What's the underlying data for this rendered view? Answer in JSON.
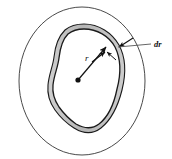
{
  "figure": {
    "labels": {
      "radius": "r",
      "thickness": "dr"
    },
    "colors": {
      "outline": "#4a4a4a",
      "blob_outline": "#1a1a1a",
      "shell_fill": "#b9b9b9",
      "shell_fill_light": "#d2d2d2",
      "background": "#ffffff",
      "label": "#111111",
      "leader": "#555555"
    },
    "geometry": {
      "outer_circle": {
        "cx": 82,
        "cy": 81,
        "r": 74,
        "stroke_width": 1
      },
      "center_dot": {
        "cx": 78,
        "cy": 80,
        "r": 2.6
      },
      "radius_arrow": {
        "x1": 78,
        "y1": 80,
        "x2": 106,
        "y2": 46
      },
      "shell_thickness_px": 4,
      "leader_line": {
        "x1": 152,
        "y1": 44,
        "x2": 117,
        "y2": 46
      },
      "dr_label_pos": {
        "x": 154,
        "y": 47
      },
      "r_label_pos": {
        "x": 86,
        "y": 60
      }
    },
    "annotations": [
      {
        "name": "shell-arrow-upper",
        "from": [
          133,
          39
        ],
        "to": [
          118,
          47
        ]
      },
      {
        "name": "shell-arrow-lower",
        "from": [
          92,
          61
        ],
        "to": [
          106,
          51
        ]
      },
      {
        "name": "shell-arrow-mid",
        "from": [
          113,
          58
        ],
        "to": [
          104,
          52
        ]
      }
    ]
  }
}
